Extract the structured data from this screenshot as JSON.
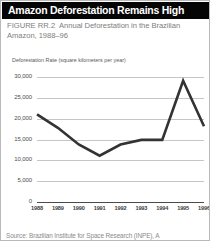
{
  "header": {
    "title": "Amazon Deforestation Remains High",
    "background_color": "#050505",
    "text_color": "#ffffff"
  },
  "caption": {
    "figure_number": "FIGURE RR.2",
    "text": "Annual Deforestation in the Brazilian Amazon, 1988–96",
    "color": "#7d7d7d"
  },
  "source": {
    "text": "Source: Brazilian Institute for Space Research (INPE), A"
  },
  "chart_data": {
    "type": "line",
    "title": "Annual Deforestation in the Brazilian Amazon, 1988–96",
    "xlabel": "",
    "ylabel": "Deforestation Rate (square kilometers per year)",
    "x": [
      "1988",
      "1989",
      "1990",
      "1991",
      "1992",
      "1993",
      "1994",
      "1995",
      "1996"
    ],
    "values": [
      21050,
      17800,
      13800,
      11100,
      13800,
      14900,
      14900,
      29100,
      18200
    ],
    "ylim": [
      0,
      30000
    ],
    "yticks": [
      0,
      5000,
      10000,
      15000,
      20000,
      25000,
      30000
    ],
    "ytick_labels": [
      "0",
      "5,000",
      "10,000",
      "15,000",
      "20,000",
      "25,000",
      "30,000"
    ],
    "grid": true,
    "legend": "none",
    "line_color": "#333333",
    "line_width": 2.6
  }
}
